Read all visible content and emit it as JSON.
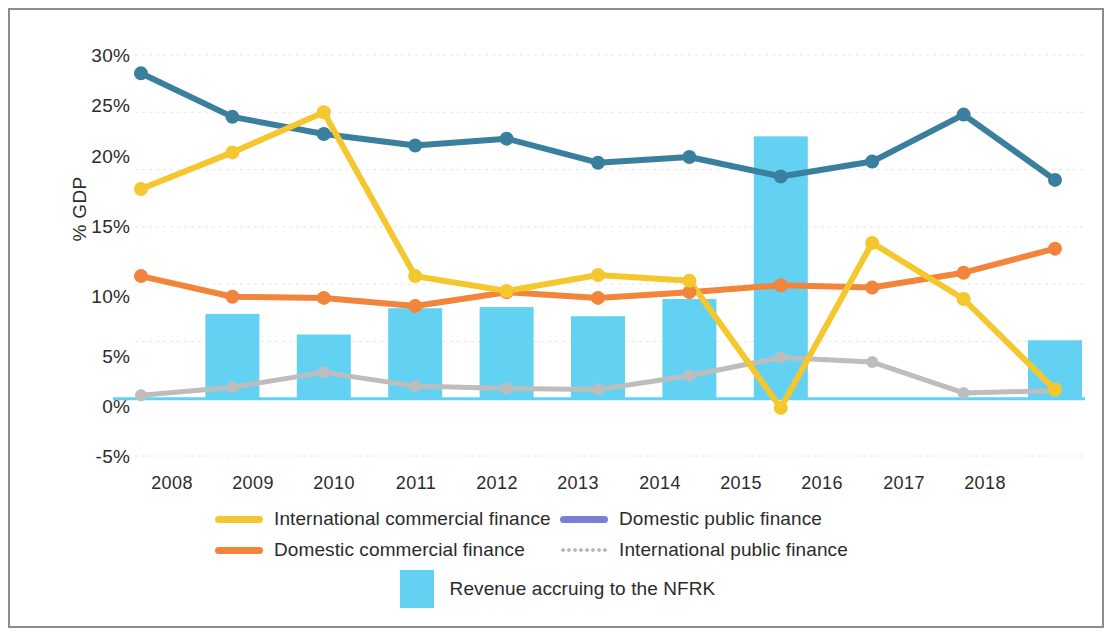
{
  "chart_data": {
    "type": "line",
    "title": "",
    "xlabel": "",
    "ylabel": "% GDP",
    "categories": [
      "2008",
      "2009",
      "2010",
      "2011",
      "2012",
      "2013",
      "2014",
      "2015",
      "2016",
      "2017",
      "2018"
    ],
    "ylim": [
      -5,
      30
    ],
    "yticks": [
      "-5%",
      "0%",
      "5%",
      "10%",
      "15%",
      "20%",
      "25%",
      "30%"
    ],
    "ytick_values": [
      -5,
      0,
      5,
      10,
      15,
      20,
      25,
      30
    ],
    "grid": true,
    "legend_position": "bottom",
    "series": [
      {
        "name": "International commercial finance",
        "type": "line",
        "color": "#f5c72e",
        "values": [
          18.3,
          21.5,
          25.0,
          10.7,
          9.4,
          10.8,
          10.3,
          -0.8,
          13.6,
          8.7,
          0.8
        ]
      },
      {
        "name": "Domestic public finance",
        "type": "line",
        "color": "#7b7fd4",
        "line_color_plot": "#3b7f9e",
        "values": [
          28.4,
          24.6,
          23.1,
          22.1,
          22.7,
          20.6,
          21.1,
          19.4,
          20.7,
          24.8,
          19.1
        ]
      },
      {
        "name": "Domestic commercial finance",
        "type": "line",
        "color": "#f2843c",
        "values": [
          10.7,
          8.9,
          8.8,
          8.1,
          9.3,
          8.8,
          9.3,
          9.9,
          9.7,
          11.0,
          13.1
        ]
      },
      {
        "name": "International public finance",
        "type": "line",
        "color": "#bdbdbd",
        "values": [
          0.3,
          1.0,
          2.3,
          1.1,
          0.9,
          0.8,
          2.0,
          3.6,
          3.2,
          0.5,
          0.7
        ]
      },
      {
        "name": "Revenue accruing to the NFRK",
        "type": "bar",
        "color": "#63d2f2",
        "values": [
          0,
          7.4,
          5.6,
          7.9,
          8.0,
          7.2,
          8.7,
          22.9,
          0,
          0,
          5.1
        ]
      }
    ]
  },
  "axis": {
    "y_title": "% GDP"
  },
  "legend": {
    "items": [
      {
        "label": "International commercial finance",
        "marker": "line-yellow"
      },
      {
        "label": "Domestic public finance",
        "marker": "line-periwinkle"
      },
      {
        "label": "Domestic commercial finance",
        "marker": "line-orange"
      },
      {
        "label": "International public finance",
        "marker": "line-dotted-gray"
      },
      {
        "label": "Revenue accruing to the NFRK",
        "marker": "box-cyan"
      }
    ]
  },
  "colors": {
    "yellow": "#f5c72e",
    "teal_blue": "#3b7f9e",
    "periwinkle": "#7b7fd4",
    "orange": "#f2843c",
    "gray": "#bdbdbd",
    "cyan": "#63d2f2",
    "frame": "#8d8d8d",
    "text": "#2b2b2b",
    "grid": "#e6e6ec"
  }
}
